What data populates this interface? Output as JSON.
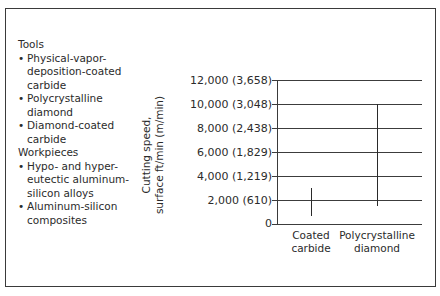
{
  "legend": {
    "tools_heading": "Tools",
    "tools": [
      "Physical-vapor-deposition-coated carbide",
      "Polycrystalline diamond",
      "Diamond-coated carbide"
    ],
    "tools_lines": [
      [
        "Physical-vapor-",
        "deposition-coated",
        "carbide"
      ],
      [
        "Polycrystalline",
        "diamond"
      ],
      [
        "Diamond-coated",
        "carbide"
      ]
    ],
    "workpieces_heading": "Workpieces",
    "workpieces": [
      "Hypo- and hyper-eutectic aluminum-silicon alloys",
      "Aluminum-silicon composites"
    ],
    "workpieces_lines": [
      [
        "Hypo- and hyper-",
        "eutectic aluminum-",
        "silicon alloys"
      ],
      [
        "Aluminum-silicon",
        "composites"
      ]
    ]
  },
  "chart_data": {
    "type": "range-bar",
    "title": "",
    "ylabel": "Cutting speed, surface ft/min (m/min)",
    "ylabel_lines": [
      "Cutting speed,",
      "surface ft/min (m/min)"
    ],
    "xlabel": "",
    "ylim": [
      0,
      12000
    ],
    "grid": true,
    "y_ticks": [
      {
        "value": 0,
        "label": "0"
      },
      {
        "value": 2000,
        "label": "2,000 (610)"
      },
      {
        "value": 4000,
        "label": "4,000 (1,219)"
      },
      {
        "value": 6000,
        "label": "6,000 (1,829)"
      },
      {
        "value": 8000,
        "label": "8,000 (2,438)"
      },
      {
        "value": 10000,
        "label": "10,000 (3,048)"
      },
      {
        "value": 12000,
        "label": "12,000 (3,658)"
      }
    ],
    "categories": [
      "Coated carbide",
      "Polycrystalline diamond"
    ],
    "category_lines": [
      [
        "Coated",
        "carbide"
      ],
      [
        "Polycrystalline",
        "diamond"
      ]
    ],
    "series": [
      {
        "name": "Cutting speed range (ft/min)",
        "low": [
          700,
          1500
        ],
        "high": [
          3000,
          10000
        ]
      }
    ]
  }
}
